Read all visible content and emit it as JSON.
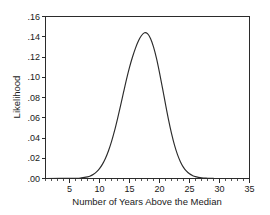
{
  "chart_data": {
    "type": "line",
    "title": "",
    "xlabel": "Number of Years Above the Median",
    "ylabel": "Likelihood",
    "xlim": [
      1,
      35
    ],
    "ylim": [
      0.0,
      0.16
    ],
    "grid": false,
    "legend": "none",
    "x_ticks": [
      5,
      10,
      15,
      20,
      25,
      30,
      35
    ],
    "x_tick_labels": [
      "5",
      "10",
      "15",
      "20",
      "25",
      "30",
      "35"
    ],
    "x_minor_tick_step": 1,
    "y_ticks": [
      0.0,
      0.02,
      0.04,
      0.06,
      0.08,
      0.1,
      0.12,
      0.14,
      0.16
    ],
    "y_tick_labels": [
      ".00",
      ".02",
      ".04",
      ".06",
      ".08",
      ".10",
      ".12",
      ".14",
      ".16"
    ],
    "peak_x": 17.5,
    "peak_y": 0.144,
    "series": [
      {
        "name": "Likelihood",
        "color": "#2b2b2b",
        "x": [
          6.0,
          7.0,
          8.0,
          8.5,
          9.0,
          9.5,
          10.0,
          10.5,
          11.0,
          11.5,
          12.0,
          12.5,
          13.0,
          13.5,
          14.0,
          14.5,
          15.0,
          15.5,
          16.0,
          16.5,
          17.0,
          17.5,
          18.0,
          18.5,
          19.0,
          19.5,
          20.0,
          20.5,
          21.0,
          21.5,
          22.0,
          22.5,
          23.0,
          23.5,
          24.0,
          24.5,
          25.0,
          25.5,
          26.0,
          27.0,
          28.0,
          29.0
        ],
        "y": [
          0.0002,
          0.0006,
          0.0016,
          0.0026,
          0.0042,
          0.0065,
          0.0098,
          0.0142,
          0.02,
          0.0274,
          0.0364,
          0.047,
          0.059,
          0.0718,
          0.085,
          0.098,
          0.1098,
          0.12,
          0.1288,
          0.136,
          0.1412,
          0.144,
          0.143,
          0.1382,
          0.13,
          0.1186,
          0.1046,
          0.0892,
          0.0734,
          0.0582,
          0.0446,
          0.033,
          0.0236,
          0.0164,
          0.011,
          0.0072,
          0.0046,
          0.0029,
          0.0018,
          0.0007,
          0.0003,
          0.0001
        ]
      }
    ]
  },
  "axis_titles": {
    "x": "Number of Years Above the Median",
    "y": "Likelihood"
  },
  "colors": {
    "curve": "#2b2b2b",
    "axis": "#2b2b2b",
    "background": "#ffffff"
  }
}
